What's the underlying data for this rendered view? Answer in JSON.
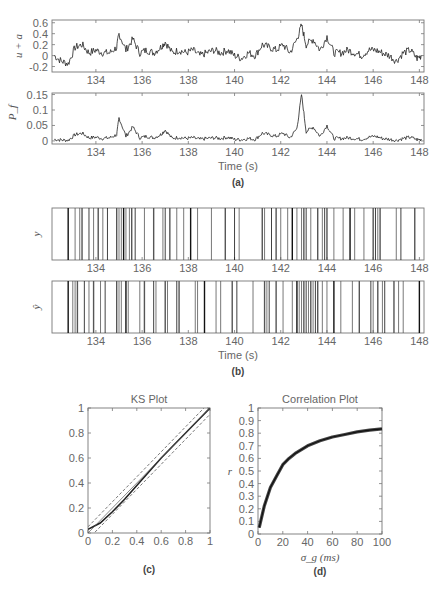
{
  "figure": {
    "panel_labels": [
      "(a)",
      "(b)",
      "(c)",
      "(d)"
    ]
  },
  "chart_data": [
    {
      "id": "a_top",
      "type": "line",
      "panel": "(a)",
      "ylabel": "u + a",
      "xlabel": "",
      "xlim": [
        132.1,
        148.2
      ],
      "ylim": [
        -0.3,
        0.65
      ],
      "xticks": [
        134,
        136,
        138,
        140,
        142,
        144,
        146,
        148
      ],
      "yticks": [
        -0.2,
        0,
        0.2,
        0.4,
        0.6
      ],
      "ytick_labels": [
        "-0.2",
        "0",
        "0.2",
        "0.4",
        "0.6"
      ],
      "description": "Noisy signal mostly between -0.2 and 0.3; peaks near 135 s (~0.4) and 143 s (~0.55)",
      "x": [
        132.2,
        132.5,
        132.8,
        133.1,
        133.4,
        133.7,
        134.0,
        134.3,
        134.6,
        134.9,
        135.0,
        135.3,
        135.6,
        135.9,
        136.2,
        136.5,
        136.8,
        137.0,
        137.3,
        137.6,
        137.9,
        138.2,
        138.5,
        138.8,
        139.1,
        139.4,
        139.7,
        140.0,
        140.3,
        140.6,
        140.9,
        141.2,
        141.5,
        141.8,
        142.1,
        142.4,
        142.7,
        142.9,
        143.1,
        143.4,
        143.7,
        144.0,
        144.3,
        144.6,
        144.9,
        145.2,
        145.5,
        145.8,
        146.1,
        146.4,
        146.7,
        147.0,
        147.3,
        147.6,
        147.9,
        148.1
      ],
      "y": [
        0.0,
        -0.1,
        -0.15,
        0.15,
        0.2,
        0.05,
        0.1,
        0.05,
        0.05,
        0.15,
        0.4,
        0.1,
        0.3,
        0.05,
        0.1,
        0.05,
        0.15,
        0.25,
        0.05,
        0.1,
        0.05,
        0.1,
        0.0,
        0.05,
        0.1,
        0.05,
        0.1,
        0.0,
        -0.05,
        0.05,
        0.0,
        0.2,
        0.15,
        0.1,
        0.2,
        0.05,
        0.3,
        0.55,
        0.2,
        0.3,
        0.1,
        0.35,
        0.05,
        0.05,
        0.1,
        0.05,
        0.0,
        0.1,
        0.1,
        0.05,
        0.0,
        -0.1,
        0.05,
        0.1,
        -0.05,
        0.0
      ]
    },
    {
      "id": "a_bottom",
      "type": "line",
      "panel": "(a)",
      "ylabel": "P_f",
      "xlabel": "Time (s)",
      "xlim": [
        132.1,
        148.2
      ],
      "ylim": [
        -0.01,
        0.155
      ],
      "xticks": [
        134,
        136,
        138,
        140,
        142,
        144,
        146,
        148
      ],
      "yticks": [
        0,
        0.05,
        0.1,
        0.15
      ],
      "ytick_labels": [
        "0",
        "0.05",
        "0.1",
        "0.15"
      ],
      "description": "Firing probability near 0.01 baseline; peaks at ~135 s (0.075) and ~143 s (0.15)",
      "x": [
        132.2,
        132.5,
        132.8,
        133.1,
        133.4,
        133.7,
        134.0,
        134.3,
        134.6,
        134.9,
        135.0,
        135.3,
        135.6,
        135.9,
        136.2,
        136.5,
        136.8,
        137.0,
        137.3,
        137.6,
        137.9,
        138.2,
        138.5,
        138.8,
        139.1,
        139.4,
        139.7,
        140.0,
        140.3,
        140.6,
        140.9,
        141.2,
        141.5,
        141.8,
        142.1,
        142.4,
        142.7,
        142.9,
        143.1,
        143.4,
        143.7,
        144.0,
        144.3,
        144.6,
        144.9,
        145.2,
        145.5,
        145.8,
        146.1,
        146.4,
        146.7,
        147.0,
        147.3,
        147.6,
        147.9,
        148.1
      ],
      "y": [
        0.005,
        0.003,
        0.002,
        0.02,
        0.025,
        0.01,
        0.012,
        0.008,
        0.01,
        0.02,
        0.075,
        0.015,
        0.045,
        0.01,
        0.015,
        0.01,
        0.02,
        0.035,
        0.008,
        0.012,
        0.008,
        0.01,
        0.005,
        0.008,
        0.01,
        0.008,
        0.012,
        0.005,
        0.004,
        0.008,
        0.005,
        0.025,
        0.02,
        0.015,
        0.025,
        0.01,
        0.04,
        0.15,
        0.03,
        0.045,
        0.015,
        0.05,
        0.008,
        0.008,
        0.01,
        0.008,
        0.005,
        0.012,
        0.015,
        0.008,
        0.005,
        0.002,
        0.008,
        0.012,
        0.004,
        0.005
      ]
    },
    {
      "id": "b_top",
      "type": "raster",
      "panel": "(b)",
      "ylabel": "y",
      "xlim": [
        132.1,
        148.2
      ],
      "xticks": [
        134,
        136,
        138,
        140,
        142,
        144,
        146,
        148
      ],
      "description": "Observed spike train raster",
      "spikes": [
        132.8,
        133.1,
        133.3,
        133.4,
        133.7,
        133.9,
        134.1,
        134.3,
        134.5,
        134.9,
        135.0,
        135.1,
        135.2,
        135.3,
        135.45,
        135.55,
        135.7,
        136.1,
        136.5,
        136.9,
        137.0,
        137.2,
        137.5,
        137.8,
        138.1,
        138.4,
        139.0,
        139.6,
        140.0,
        140.2,
        141.2,
        141.3,
        141.6,
        141.8,
        142.0,
        142.3,
        142.5,
        142.7,
        142.9,
        143.0,
        143.1,
        143.3,
        143.6,
        143.8,
        143.9,
        144.0,
        144.3,
        144.7,
        145.0,
        145.2,
        145.6,
        146.0,
        146.1,
        146.2,
        146.3,
        147.0,
        147.2,
        147.8
      ]
    },
    {
      "id": "b_bottom",
      "type": "raster",
      "panel": "(b)",
      "ylabel": "ŷ",
      "xlabel": "Time (s)",
      "xlim": [
        132.1,
        148.2
      ],
      "xticks": [
        134,
        136,
        138,
        140,
        142,
        144,
        146,
        148
      ],
      "description": "Decoded/predicted spike train raster",
      "spikes": [
        132.8,
        133.0,
        133.1,
        133.2,
        133.5,
        133.7,
        133.9,
        134.2,
        134.4,
        134.9,
        135.0,
        135.1,
        135.3,
        135.4,
        135.9,
        136.1,
        136.5,
        136.6,
        137.0,
        137.1,
        137.5,
        137.6,
        138.3,
        138.4,
        138.7,
        139.2,
        139.4,
        139.9,
        140.1,
        140.8,
        141.3,
        141.4,
        141.5,
        141.8,
        142.1,
        142.5,
        142.7,
        142.8,
        142.9,
        143.0,
        143.1,
        143.2,
        143.3,
        143.4,
        143.5,
        143.6,
        143.8,
        144.0,
        144.3,
        144.6,
        145.1,
        145.4,
        145.9,
        146.0,
        146.2,
        146.4,
        146.5,
        146.9,
        147.1,
        147.3,
        148.0
      ]
    },
    {
      "id": "c",
      "type": "line",
      "panel": "(c)",
      "title": "KS Plot",
      "xlabel": "",
      "ylabel": "",
      "xlim": [
        0,
        1
      ],
      "ylim": [
        0,
        1
      ],
      "xticks": [
        0,
        0.2,
        0.4,
        0.6,
        0.8,
        1
      ],
      "xtick_labels": [
        "0",
        "0.2",
        "0.4",
        "0.6",
        "0.8",
        "1"
      ],
      "yticks": [
        0,
        0.2,
        0.4,
        0.6,
        0.8,
        1
      ],
      "ytick_labels": [
        "0",
        "0.2",
        "0.4",
        "0.6",
        "0.8",
        "1"
      ],
      "series": [
        {
          "name": "KS curve",
          "style": "solid-thick",
          "x": [
            0,
            0.1,
            0.2,
            0.3,
            0.4,
            0.5,
            0.6,
            0.7,
            0.8,
            0.9,
            1.0
          ],
          "y": [
            0.03,
            0.08,
            0.17,
            0.27,
            0.38,
            0.49,
            0.6,
            0.7,
            0.8,
            0.9,
            1.0
          ]
        },
        {
          "name": "45° line",
          "style": "solid-thin",
          "x": [
            0,
            1
          ],
          "y": [
            0,
            1
          ]
        },
        {
          "name": "upper 95% bound",
          "style": "dashed",
          "x": [
            0,
            1
          ],
          "y": [
            0.05,
            1.05
          ]
        },
        {
          "name": "lower 95% bound",
          "style": "dashed",
          "x": [
            0,
            1
          ],
          "y": [
            -0.05,
            0.95
          ]
        }
      ]
    },
    {
      "id": "d",
      "type": "line",
      "panel": "(d)",
      "title": "Correlation Plot",
      "xlabel": "σ_g (ms)",
      "ylabel": "r",
      "xlim": [
        0,
        100
      ],
      "ylim": [
        0,
        1
      ],
      "xticks": [
        0,
        20,
        40,
        60,
        80,
        100
      ],
      "xtick_labels": [
        "0",
        "20",
        "40",
        "60",
        "80",
        "100"
      ],
      "yticks": [
        0,
        0.1,
        0.2,
        0.3,
        0.4,
        0.5,
        0.6,
        0.7,
        0.8,
        0.9,
        1
      ],
      "ytick_labels": [
        "0",
        "0.1",
        "0.2",
        "0.3",
        "0.4",
        "0.5",
        "0.6",
        "0.7",
        "0.8",
        "0.9",
        "1"
      ],
      "series": [
        {
          "name": "r",
          "x": [
            1,
            5,
            10,
            15,
            20,
            25,
            30,
            40,
            50,
            60,
            70,
            80,
            90,
            100
          ],
          "y": [
            0.05,
            0.22,
            0.37,
            0.46,
            0.55,
            0.6,
            0.64,
            0.7,
            0.74,
            0.77,
            0.79,
            0.81,
            0.825,
            0.835
          ]
        }
      ]
    }
  ]
}
